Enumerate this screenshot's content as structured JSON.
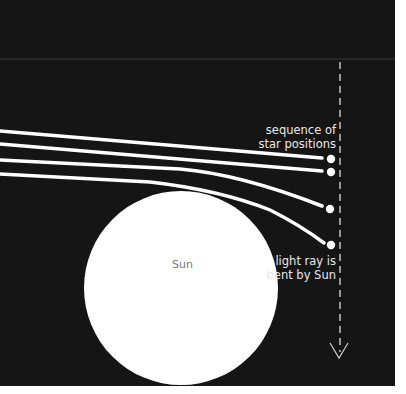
{
  "diagram": {
    "colors": {
      "background": "#151515",
      "rays": "#ffffff",
      "sun": "#ffffff",
      "divider": "#3a3a3a",
      "dashed_line": "#cfcfcf",
      "text": "#e8e8e8",
      "sun_text": "#777777"
    },
    "labels": {
      "sequence_line1": "sequence of",
      "sequence_line2": "star positions",
      "bent_line1": "light ray is",
      "bent_line2": "bent by Sun",
      "sun": "Sun"
    },
    "sun": {
      "cx": 181,
      "cy": 288,
      "r": 97
    },
    "rays": [
      {
        "start": [
          0,
          131
        ],
        "end": [
          331,
          159
        ]
      },
      {
        "start": [
          0,
          144
        ],
        "end": [
          331,
          172
        ]
      },
      {
        "start": [
          0,
          160
        ],
        "end": [
          330,
          209
        ]
      },
      {
        "start": [
          0,
          174
        ],
        "end": [
          325,
          245
        ]
      }
    ],
    "star_positions": [
      {
        "x": 331,
        "y": 159
      },
      {
        "x": 331,
        "y": 172
      },
      {
        "x": 330,
        "y": 209
      },
      {
        "x": 331,
        "y": 245
      }
    ],
    "dashed_line": {
      "x": 340,
      "y1": 62,
      "y2": 355,
      "arrow": "down"
    }
  }
}
